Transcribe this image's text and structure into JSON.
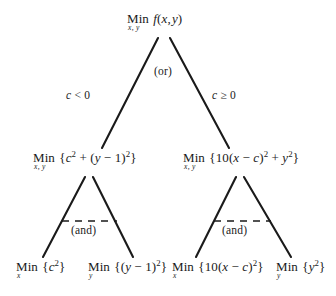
{
  "diagram": {
    "type": "decision-tree",
    "canvas": {
      "width": 336,
      "height": 296,
      "background": "#ffffff",
      "ink": "#1a1a1a"
    },
    "root": {
      "min_label": "Min",
      "subscript": "x, y",
      "expression": "f(x, y)",
      "full_text": "Min f(x, y)",
      "subscript_full": "x, y"
    },
    "or_label": "(or)",
    "branch_labels": {
      "left": "c < 0",
      "right": "c ≥ 0"
    },
    "level2": {
      "left": {
        "min_label": "Min",
        "subscript": "x, y",
        "expression": "{c² + (y − 1)²}",
        "full_text": "Min {c² + (y − 1)²}"
      },
      "right": {
        "min_label": "Min",
        "subscript": "x, y",
        "expression": "{10(x − c)² + y²}",
        "full_text": "Min {10(x − c)² + y²}"
      }
    },
    "and_labels": {
      "left": "(and)",
      "right": "(and)"
    },
    "leaves": [
      {
        "min_label": "Min",
        "subscript": "x",
        "expression": "{c²}",
        "full_text": "Min {c²}"
      },
      {
        "min_label": "Min",
        "subscript": "y",
        "expression": "{(y − 1)²}",
        "full_text": "Min {(y − 1)²}"
      },
      {
        "min_label": "Min",
        "subscript": "x",
        "expression": "{10(x − c)²}",
        "full_text": "Min {10(x − c)²}"
      },
      {
        "min_label": "Min",
        "subscript": "y",
        "expression": "{y²}",
        "full_text": "Min {y²}"
      }
    ]
  }
}
